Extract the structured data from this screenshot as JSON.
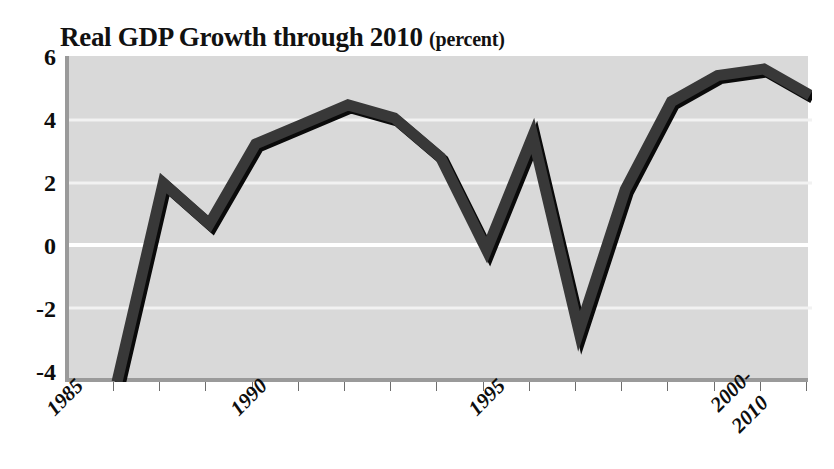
{
  "chart_data": {
    "type": "line",
    "title": "Real GDP Growth through 2010",
    "title_unit": "(percent)",
    "xlabel": "",
    "ylabel": "",
    "ylim": [
      -4,
      6
    ],
    "yticks": [
      6,
      4,
      2,
      0,
      -2,
      -4
    ],
    "ytick_labels": [
      "6",
      "4",
      "2",
      "0",
      "-2",
      "-4"
    ],
    "grid": true,
    "legend": "none",
    "x": [
      "1985",
      "1986",
      "1987",
      "1988",
      "1989",
      "1990",
      "1991",
      "1992",
      "1993",
      "1994",
      "1995",
      "1996",
      "1997",
      "1998",
      "1999",
      "2000-2010"
    ],
    "xtick_labels": [
      "1985",
      "1990",
      "1995",
      "2000-\n2010"
    ],
    "xtick_label_1": "1985",
    "xtick_label_2": "1990",
    "xtick_label_3": "1995",
    "xtick_label_4a": "2000-",
    "xtick_label_4b": "2010",
    "values": [
      -4.0,
      2.1,
      0.85,
      3.3,
      3.9,
      4.5,
      4.1,
      2.9,
      0.05,
      3.55,
      -2.45,
      1.9,
      4.6,
      5.4,
      5.6,
      4.8
    ],
    "series": [
      {
        "name": "Real GDP Growth",
        "values": [
          -4.0,
          2.1,
          0.85,
          3.3,
          3.9,
          4.5,
          4.1,
          2.9,
          0.05,
          3.55,
          -2.45,
          1.9,
          4.6,
          5.4,
          5.6,
          4.8
        ]
      }
    ],
    "colors": {
      "line": "#333333",
      "line_shadow": "#0a0a0a",
      "plot_background": "#d9d9d9",
      "gridline": "#f4f4f4",
      "zero_gridline": "#ffffff",
      "axis": "#9a9a9a",
      "text": "#0d0d0d"
    }
  }
}
